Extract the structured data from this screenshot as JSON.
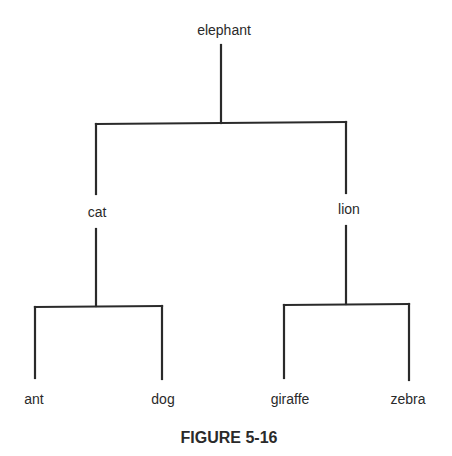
{
  "tree": {
    "root": "elephant",
    "level1": [
      "cat",
      "lion"
    ],
    "level2_left": [
      "ant",
      "dog"
    ],
    "level2_right": [
      "giraffe",
      "zebra"
    ]
  },
  "caption": "FIGURE 5-16"
}
